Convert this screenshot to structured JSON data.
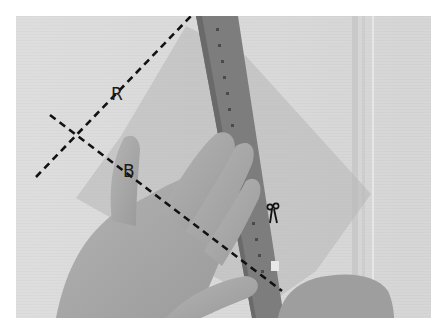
{
  "figure": {
    "labels": {
      "line_r": "R",
      "line_b": "B"
    },
    "icons": {
      "cut_marker": "scissors-icon"
    },
    "colors": {
      "background": "#ffffff",
      "wall": "#d9d9d9",
      "sheet": "#bfbfbf",
      "ruler": "#7d7d7d",
      "skin": "#a8a8a8",
      "dashed_line": "#111111"
    }
  }
}
